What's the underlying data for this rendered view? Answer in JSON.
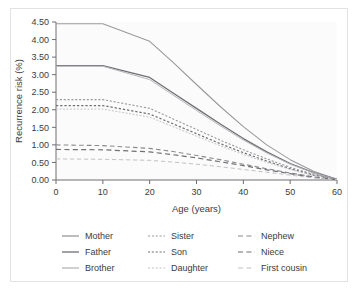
{
  "figure": {
    "background_color": "#ffffff",
    "border_color": "#e2e2e4",
    "plot_background": "#fbfbfb",
    "axis_color": "#6e6e72",
    "text_color": "#3c3c3c"
  },
  "chart_data": {
    "type": "line",
    "title": "",
    "xlabel": "Age (years)",
    "ylabel": "Recurrence risk (%)",
    "xlim": [
      0,
      60
    ],
    "ylim": [
      0,
      4.5
    ],
    "xticks": [
      0,
      10,
      20,
      30,
      40,
      50,
      60
    ],
    "xticklabels": [
      "0",
      "10",
      "20",
      "30",
      "40",
      "50",
      "60"
    ],
    "yticks": [
      0.0,
      0.5,
      1.0,
      1.5,
      2.0,
      2.5,
      3.0,
      3.5,
      4.0,
      4.5
    ],
    "yticklabels": [
      "0.00",
      "0.50",
      "1.00",
      "1.50",
      "2.00",
      "2.50",
      "3.00",
      "3.50",
      "4.00",
      "4.50"
    ],
    "grid": false,
    "legend_position": "below",
    "legend_columns": 3,
    "x": [
      0,
      10,
      20,
      25,
      30,
      35,
      40,
      45,
      50,
      55,
      60
    ],
    "series": [
      {
        "name": "Mother",
        "style": "solid",
        "color": "#9a9a9e",
        "width": 1.1,
        "values": [
          4.45,
          4.45,
          3.95,
          3.35,
          2.72,
          2.1,
          1.52,
          1.0,
          0.58,
          0.25,
          0.02
        ]
      },
      {
        "name": "Father",
        "style": "solid",
        "color": "#6f6f74",
        "width": 1.3,
        "values": [
          3.26,
          3.26,
          2.92,
          2.48,
          2.04,
          1.6,
          1.18,
          0.8,
          0.47,
          0.21,
          0.02
        ]
      },
      {
        "name": "Brother",
        "style": "solid",
        "color": "#b6b6ba",
        "width": 1.0,
        "values": [
          3.24,
          3.24,
          2.86,
          2.42,
          1.98,
          1.55,
          1.14,
          0.77,
          0.45,
          0.2,
          0.02
        ]
      },
      {
        "name": "Sister",
        "style": "dotted",
        "color": "#9a9a9e",
        "width": 1.1,
        "values": [
          2.29,
          2.29,
          2.04,
          1.74,
          1.44,
          1.14,
          0.86,
          0.6,
          0.36,
          0.16,
          0.02
        ]
      },
      {
        "name": "Son",
        "style": "dotted",
        "color": "#6f6f74",
        "width": 1.2,
        "values": [
          2.12,
          2.12,
          1.88,
          1.6,
          1.32,
          1.04,
          0.78,
          0.54,
          0.32,
          0.14,
          0.02
        ]
      },
      {
        "name": "Daughter",
        "style": "dotted",
        "color": "#c2c2c6",
        "width": 1.0,
        "values": [
          2.02,
          2.02,
          1.79,
          1.52,
          1.25,
          0.98,
          0.73,
          0.5,
          0.3,
          0.13,
          0.02
        ]
      },
      {
        "name": "Nephew",
        "style": "dashed",
        "color": "#8a8a8e",
        "width": 1.1,
        "values": [
          1.0,
          0.98,
          0.9,
          0.81,
          0.7,
          0.58,
          0.45,
          0.32,
          0.2,
          0.09,
          0.01
        ]
      },
      {
        "name": "Niece",
        "style": "dashed",
        "color": "#6f6f74",
        "width": 1.2,
        "values": [
          0.87,
          0.86,
          0.8,
          0.72,
          0.63,
          0.52,
          0.41,
          0.29,
          0.18,
          0.08,
          0.01
        ]
      },
      {
        "name": "First cousin",
        "style": "dashed",
        "color": "#c2c2c6",
        "width": 1.0,
        "values": [
          0.6,
          0.59,
          0.56,
          0.51,
          0.45,
          0.38,
          0.3,
          0.22,
          0.14,
          0.06,
          0.01
        ]
      }
    ]
  },
  "legend": {
    "columns": [
      {
        "entries": [
          {
            "label": "Mother",
            "style": "solid",
            "color": "#9a9a9e"
          },
          {
            "label": "Father",
            "style": "solid",
            "color": "#6f6f74"
          },
          {
            "label": "Brother",
            "style": "solid",
            "color": "#b6b6ba"
          }
        ]
      },
      {
        "entries": [
          {
            "label": "Sister",
            "style": "dotted",
            "color": "#9a9a9e"
          },
          {
            "label": "Son",
            "style": "dotted",
            "color": "#6f6f74"
          },
          {
            "label": "Daughter",
            "style": "dotted",
            "color": "#c2c2c6"
          }
        ]
      },
      {
        "entries": [
          {
            "label": "Nephew",
            "style": "dashed",
            "color": "#8a8a8e"
          },
          {
            "label": "Niece",
            "style": "dashed",
            "color": "#6f6f74"
          },
          {
            "label": "First cousin",
            "style": "dashed",
            "color": "#c2c2c6"
          }
        ]
      }
    ]
  }
}
